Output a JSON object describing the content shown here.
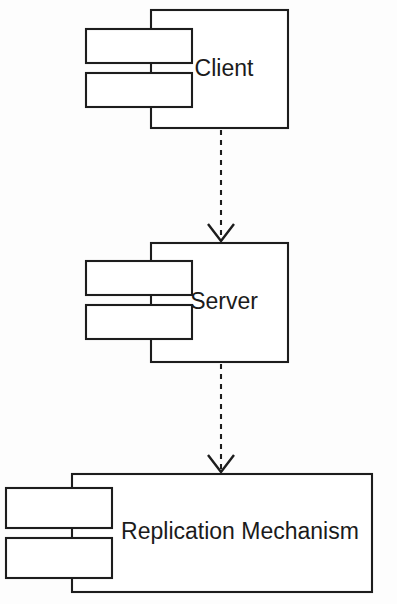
{
  "diagram": {
    "kind": "uml-component-diagram",
    "background_color": "#fdfdfd",
    "line_color": "#1d1d1d",
    "fill_color": "#ffffff",
    "components": [
      {
        "id": "client",
        "label": "Client",
        "label_x": 224,
        "label_y": 70,
        "box": {
          "x": 151,
          "y": 10,
          "w": 137,
          "h": 118
        },
        "ports": [
          {
            "x": 86,
            "y": 29,
            "w": 106,
            "h": 34
          },
          {
            "x": 86,
            "y": 73,
            "w": 106,
            "h": 34
          }
        ]
      },
      {
        "id": "server",
        "label": "Server",
        "label_x": 224,
        "label_y": 303,
        "box": {
          "x": 151,
          "y": 243,
          "w": 137,
          "h": 119
        },
        "ports": [
          {
            "x": 86,
            "y": 261,
            "w": 106,
            "h": 34
          },
          {
            "x": 86,
            "y": 305,
            "w": 106,
            "h": 34
          }
        ]
      },
      {
        "id": "replication-mechanism",
        "label": "Replication Mechanism",
        "label_x": 240,
        "label_y": 533,
        "box": {
          "x": 72,
          "y": 474,
          "w": 300,
          "h": 118
        },
        "ports": [
          {
            "x": 6,
            "y": 488,
            "w": 106,
            "h": 40
          },
          {
            "x": 6,
            "y": 538,
            "w": 106,
            "h": 40
          }
        ]
      }
    ],
    "dependencies": [
      {
        "id": "client-to-server",
        "from": "client",
        "to": "server",
        "style": "dashed",
        "arrowhead": "open-v",
        "x": 221,
        "y_start": 130,
        "y_end": 241,
        "head_half_width": 13,
        "head_height": 17
      },
      {
        "id": "server-to-replication",
        "from": "server",
        "to": "replication-mechanism",
        "style": "dashed",
        "arrowhead": "open-v",
        "x": 221,
        "y_start": 364,
        "y_end": 472,
        "head_half_width": 13,
        "head_height": 17
      }
    ]
  }
}
